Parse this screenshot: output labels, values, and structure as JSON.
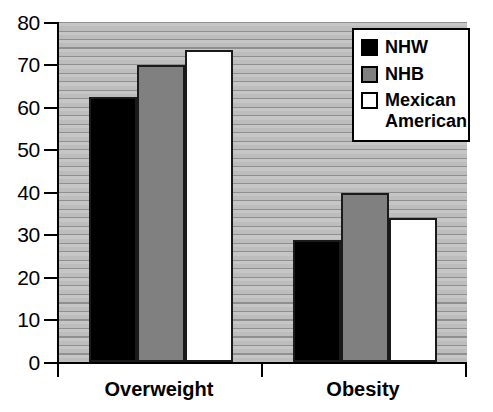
{
  "chart_data": {
    "type": "bar",
    "title": "",
    "subtitle": "",
    "xlabel": "",
    "ylabel": "",
    "categories": [
      "Overweight",
      "Obesity"
    ],
    "series": [
      {
        "name": "NHW",
        "color": "#000000",
        "values": [
          62.3,
          28.8
        ]
      },
      {
        "name": "NHB",
        "color": "#808080",
        "values": [
          69.8,
          39.7
        ]
      },
      {
        "name": "Mexican American",
        "color": "#ffffff",
        "values": [
          73.5,
          34.0
        ]
      }
    ],
    "ylim": [
      0,
      80
    ],
    "ytick_values": [
      0,
      10,
      20,
      30,
      40,
      50,
      60,
      70,
      80
    ],
    "ytick_labels": [
      "0",
      "10",
      "20",
      "30",
      "40",
      "50",
      "60",
      "70",
      "80"
    ],
    "grid": true,
    "grid_orientation": "horizontal",
    "legend_position": "top-right",
    "plot_background": "#b4b4b4",
    "axis_color": "#000000"
  },
  "legend": {
    "entries": [
      {
        "label": "NHW",
        "swatch": "black-swatch"
      },
      {
        "label": "NHB",
        "swatch": "gray-swatch"
      },
      {
        "label": "Mexican\nAmerican",
        "swatch": "white-swatch"
      }
    ]
  },
  "x_axis": {
    "categories": [
      {
        "label": "Overweight"
      },
      {
        "label": "Obesity"
      }
    ]
  },
  "y_axis": {
    "ticks": [
      {
        "label": "80"
      },
      {
        "label": "70"
      },
      {
        "label": "60"
      },
      {
        "label": "50"
      },
      {
        "label": "40"
      },
      {
        "label": "30"
      },
      {
        "label": "20"
      },
      {
        "label": "10"
      },
      {
        "label": "0"
      }
    ]
  }
}
